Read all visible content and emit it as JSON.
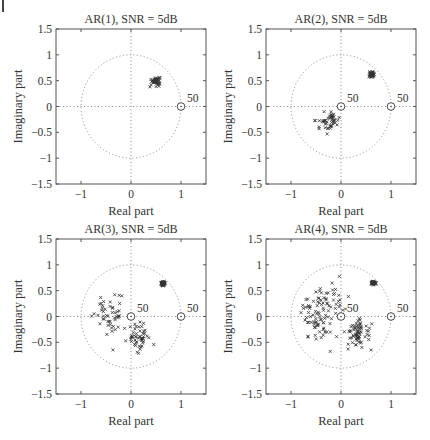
{
  "figure": {
    "layout": "2x2 grid of pole-zero scatter plots"
  },
  "chart_data": [
    {
      "type": "scatter",
      "title": "AR(1), SNR = 5dB",
      "xlabel": "Real part",
      "ylabel": "Imaginary part",
      "xlim": [
        -1.5,
        1.5
      ],
      "ylim": [
        -1.5,
        1.5
      ],
      "xticks": [
        "-1",
        "0",
        "1"
      ],
      "xtick_values": [
        -1,
        0,
        1
      ],
      "yticks": [
        "-1.5",
        "-1",
        "-0.5",
        "0",
        "0.5",
        "1",
        "1.5"
      ],
      "ytick_values": [
        -1.5,
        -1,
        -0.5,
        0,
        0.5,
        1,
        1.5
      ],
      "grid": "dotted axes at x=0 and y=0",
      "unit_circle": true,
      "circle_markers": [
        {
          "x": 1,
          "y": 0,
          "label": "50"
        }
      ],
      "clusters": [
        {
          "name": "pole estimates",
          "marker": "x",
          "center": [
            0.5,
            0.5
          ],
          "spread": [
            0.05,
            0.05
          ],
          "count": 50,
          "tail": [
            [
              0.38,
              0.38
            ],
            [
              0.4,
              0.42
            ]
          ]
        }
      ]
    },
    {
      "type": "scatter",
      "title": "AR(2), SNR = 5dB",
      "xlabel": "Real part",
      "ylabel": "Imaginary part",
      "xlim": [
        -1.5,
        1.5
      ],
      "ylim": [
        -1.5,
        1.5
      ],
      "xticks": [
        "-1",
        "0",
        "1"
      ],
      "xtick_values": [
        -1,
        0,
        1
      ],
      "yticks": [
        "-1.5",
        "-1",
        "-0.5",
        "0",
        "0.5",
        "1",
        "1.5"
      ],
      "ytick_values": [
        -1.5,
        -1,
        -0.5,
        0,
        0.5,
        1,
        1.5
      ],
      "grid": "dotted axes at x=0 and y=0",
      "unit_circle": true,
      "circle_markers": [
        {
          "x": 0,
          "y": 0,
          "label": "50"
        },
        {
          "x": 1,
          "y": 0,
          "label": "50"
        }
      ],
      "clusters": [
        {
          "name": "pole estimates",
          "marker": "x",
          "center": [
            0.62,
            0.62
          ],
          "spread": [
            0.03,
            0.03
          ],
          "count": 50
        },
        {
          "name": "spurious estimates",
          "marker": "x",
          "center": [
            -0.25,
            -0.3
          ],
          "spread": [
            0.14,
            0.12
          ],
          "count": 50
        }
      ]
    },
    {
      "type": "scatter",
      "title": "AR(3), SNR = 5dB",
      "xlabel": "Real part",
      "ylabel": "Imaginary part",
      "xlim": [
        -1.5,
        1.5
      ],
      "ylim": [
        -1.5,
        1.5
      ],
      "xticks": [
        "-1",
        "0",
        "1"
      ],
      "xtick_values": [
        -1,
        0,
        1
      ],
      "yticks": [
        "-1.5",
        "-1",
        "-0.5",
        "0",
        "0.5",
        "1",
        "1.5"
      ],
      "ytick_values": [
        -1.5,
        -1,
        -0.5,
        0,
        0.5,
        1,
        1.5
      ],
      "grid": "dotted axes at x=0 and y=0",
      "unit_circle": true,
      "circle_markers": [
        {
          "x": 0,
          "y": 0,
          "label": "50"
        },
        {
          "x": 1,
          "y": 0,
          "label": "50"
        }
      ],
      "clusters": [
        {
          "name": "pole estimates",
          "marker": "x",
          "center": [
            0.64,
            0.64
          ],
          "spread": [
            0.025,
            0.025
          ],
          "count": 50
        },
        {
          "name": "spurious estimates A",
          "marker": "x",
          "center": [
            -0.4,
            0.0
          ],
          "spread": [
            0.18,
            0.25
          ],
          "count": 50
        },
        {
          "name": "spurious estimates B",
          "marker": "x",
          "center": [
            0.15,
            -0.4
          ],
          "spread": [
            0.15,
            0.18
          ],
          "count": 50
        }
      ]
    },
    {
      "type": "scatter",
      "title": "AR(4), SNR = 5dB",
      "xlabel": "Real part",
      "ylabel": "Imaginary part",
      "xlim": [
        -1.5,
        1.5
      ],
      "ylim": [
        -1.5,
        1.5
      ],
      "xticks": [
        "-1",
        "0",
        "1"
      ],
      "xtick_values": [
        -1,
        0,
        1
      ],
      "yticks": [
        "-1.5",
        "-1",
        "-0.5",
        "0",
        "0.5",
        "1",
        "1.5"
      ],
      "ytick_values": [
        -1.5,
        -1,
        -0.5,
        0,
        0.5,
        1,
        1.5
      ],
      "grid": "dotted axes at x=0 and y=0",
      "unit_circle": true,
      "circle_markers": [
        {
          "x": 0,
          "y": 0,
          "label": "50"
        },
        {
          "x": 1,
          "y": 0,
          "label": "50"
        }
      ],
      "clusters": [
        {
          "name": "pole estimates",
          "marker": "x",
          "center": [
            0.65,
            0.65
          ],
          "spread": [
            0.025,
            0.02
          ],
          "count": 50
        },
        {
          "name": "spurious estimates A",
          "marker": "x",
          "center": [
            -0.45,
            0.0
          ],
          "spread": [
            0.2,
            0.35
          ],
          "count": 80
        },
        {
          "name": "spurious estimates B",
          "marker": "x",
          "center": [
            0.35,
            -0.3
          ],
          "spread": [
            0.15,
            0.2
          ],
          "count": 70
        },
        {
          "name": "spurious estimates C",
          "marker": "x",
          "center": [
            -0.1,
            0.35
          ],
          "spread": [
            0.15,
            0.2
          ],
          "count": 20
        }
      ]
    }
  ],
  "panels": [
    {
      "title": "AR(1), SNR = 5dB",
      "xlabel": "Real part",
      "ylabel": "Imaginary part"
    },
    {
      "title": "AR(2), SNR = 5dB",
      "xlabel": "Real part",
      "ylabel": "Imaginary part"
    },
    {
      "title": "AR(3), SNR = 5dB",
      "xlabel": "Real part",
      "ylabel": "Imaginary part"
    },
    {
      "title": "AR(4), SNR = 5dB",
      "xlabel": "Real part",
      "ylabel": "Imaginary part"
    }
  ],
  "colors": {
    "axes": "#555555",
    "grid": "#888888",
    "markers": "#333333"
  }
}
